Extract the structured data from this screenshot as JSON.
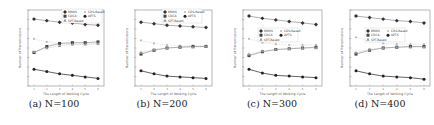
{
  "figure": {
    "captions": [
      "(a) N=100",
      "(b) N=200",
      "(c) N=300",
      "(d) N=400"
    ]
  },
  "chart_data": [
    {
      "type": "line",
      "caption": "(a) N=100",
      "xlabel": "The Length of Working Cycle",
      "ylabel": "Number of Transmissions",
      "x": [
        1,
        2,
        3,
        4,
        5,
        6
      ],
      "grid": false,
      "legend_position": "upper center (inside)",
      "series": [
        {
          "name": "BRWS",
          "marker": "diamond",
          "values": [
            0.88,
            0.86,
            0.84,
            0.83,
            0.81,
            0.8
          ]
        },
        {
          "name": "CDS-Based",
          "marker": "dot",
          "values": [
            0.62,
            0.58,
            0.56,
            0.55,
            0.55,
            0.55
          ]
        },
        {
          "name": "CDCA",
          "marker": "square",
          "values": [
            0.44,
            0.52,
            0.56,
            0.57,
            0.57,
            0.58
          ]
        },
        {
          "name": "APTS",
          "marker": "star",
          "values": [
            0.22,
            0.19,
            0.16,
            0.14,
            0.12,
            0.1
          ]
        },
        {
          "name": "SPT-Based",
          "marker": "triangle",
          "values": [
            0.45,
            0.5,
            0.53,
            0.55,
            0.55,
            0.56
          ]
        }
      ],
      "ylim": [
        0,
        1
      ]
    },
    {
      "type": "line",
      "caption": "(b) N=200",
      "xlabel": "The Length of Working Cycle",
      "ylabel": "Number of Transmissions",
      "x": [
        1,
        2,
        3,
        4,
        5,
        6
      ],
      "grid": false,
      "legend_position": "upper right (inside)",
      "series": [
        {
          "name": "BRWS",
          "marker": "diamond",
          "values": [
            0.84,
            0.82,
            0.8,
            0.79,
            0.78,
            0.77
          ]
        },
        {
          "name": "CDS-Based",
          "marker": "dot",
          "values": [
            0.6,
            0.56,
            0.54,
            0.53,
            0.53,
            0.53
          ]
        },
        {
          "name": "CDCA",
          "marker": "square",
          "values": [
            0.42,
            0.47,
            0.5,
            0.51,
            0.52,
            0.52
          ]
        },
        {
          "name": "APTS",
          "marker": "star",
          "values": [
            0.2,
            0.16,
            0.13,
            0.12,
            0.11,
            0.1
          ]
        },
        {
          "name": "SPT-Based",
          "marker": "triangle",
          "values": [
            0.44,
            0.48,
            0.5,
            0.51,
            0.51,
            0.52
          ]
        }
      ],
      "ylim": [
        0,
        1
      ]
    },
    {
      "type": "line",
      "caption": "(c) N=300",
      "xlabel": "The Length of Working Cycle",
      "ylabel": "Number of Transmissions",
      "x": [
        1,
        2,
        3,
        4,
        5,
        6
      ],
      "grid": false,
      "legend_position": "center right (inside)",
      "series": [
        {
          "name": "BRWS",
          "marker": "diamond",
          "values": [
            0.92,
            0.89,
            0.87,
            0.85,
            0.83,
            0.81
          ]
        },
        {
          "name": "CDS-Based",
          "marker": "dot",
          "values": [
            0.62,
            0.57,
            0.55,
            0.54,
            0.54,
            0.54
          ]
        },
        {
          "name": "CDCA",
          "marker": "square",
          "values": [
            0.4,
            0.45,
            0.48,
            0.49,
            0.5,
            0.51
          ]
        },
        {
          "name": "APTS",
          "marker": "star",
          "values": [
            0.22,
            0.17,
            0.14,
            0.13,
            0.12,
            0.11
          ]
        },
        {
          "name": "SPT-Based",
          "marker": "triangle",
          "values": [
            0.42,
            0.46,
            0.48,
            0.49,
            0.5,
            0.5
          ]
        }
      ],
      "ylim": [
        0,
        1
      ]
    },
    {
      "type": "line",
      "caption": "(d) N=400",
      "xlabel": "The Length of Working Cycle",
      "ylabel": "Number of Transmissions",
      "x": [
        1,
        2,
        3,
        4,
        5,
        6
      ],
      "grid": false,
      "legend_position": "center right (inside)",
      "series": [
        {
          "name": "BRWS",
          "marker": "diamond",
          "values": [
            0.92,
            0.9,
            0.88,
            0.86,
            0.85,
            0.83
          ]
        },
        {
          "name": "CDS-Based",
          "marker": "dot",
          "values": [
            0.64,
            0.59,
            0.56,
            0.55,
            0.55,
            0.55
          ]
        },
        {
          "name": "CDCA",
          "marker": "square",
          "values": [
            0.42,
            0.47,
            0.5,
            0.51,
            0.52,
            0.52
          ]
        },
        {
          "name": "APTS",
          "marker": "star",
          "values": [
            0.2,
            0.16,
            0.13,
            0.12,
            0.11,
            0.09
          ]
        },
        {
          "name": "SPT-Based",
          "marker": "triangle",
          "values": [
            0.44,
            0.48,
            0.5,
            0.51,
            0.51,
            0.51
          ]
        }
      ],
      "ylim": [
        0,
        1
      ]
    }
  ]
}
